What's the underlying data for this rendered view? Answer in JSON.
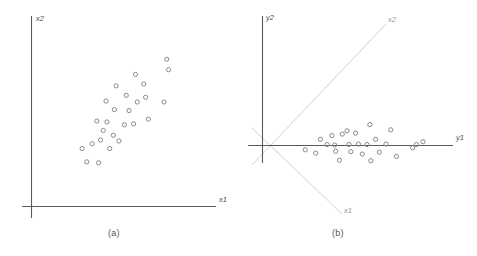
{
  "figure": {
    "background_color": "#ffffff",
    "axis_color": "#5a5a5a",
    "guide_color": "#d2d2d2",
    "point_color": "#8a8a8a",
    "caption_color": "#555555"
  },
  "panels": {
    "a": {
      "caption": "(a)",
      "x_axis_label": "x1",
      "y_axis_label": "x2"
    },
    "b": {
      "caption": "(b)",
      "x_axis_label": "y1",
      "y_axis_label": "y2",
      "rotated_x_axis_label": "x1",
      "rotated_y_axis_label": "x2"
    }
  },
  "chart_data": [
    {
      "type": "scatter",
      "title": "(a)",
      "xlabel": "x1",
      "ylabel": "x2",
      "grid": false,
      "legend": null,
      "axis_ticks": false,
      "xlim": [
        0,
        100
      ],
      "ylim": [
        0,
        100
      ],
      "description": "Positively correlated elliptical cloud of points in the original x1-x2 coordinate frame",
      "points": [
        {
          "x": 30.0,
          "y": 23.5
        },
        {
          "x": 36.5,
          "y": 23.0
        },
        {
          "x": 27.5,
          "y": 30.5
        },
        {
          "x": 33.0,
          "y": 33.0
        },
        {
          "x": 37.5,
          "y": 35.0
        },
        {
          "x": 42.5,
          "y": 30.5
        },
        {
          "x": 39.0,
          "y": 40.0
        },
        {
          "x": 44.5,
          "y": 37.5
        },
        {
          "x": 47.5,
          "y": 34.5
        },
        {
          "x": 35.5,
          "y": 45.0
        },
        {
          "x": 41.0,
          "y": 44.5
        },
        {
          "x": 50.5,
          "y": 43.0
        },
        {
          "x": 55.5,
          "y": 43.5
        },
        {
          "x": 45.0,
          "y": 51.0
        },
        {
          "x": 53.0,
          "y": 50.5
        },
        {
          "x": 63.5,
          "y": 46.0
        },
        {
          "x": 40.5,
          "y": 55.5
        },
        {
          "x": 57.5,
          "y": 55.0
        },
        {
          "x": 51.5,
          "y": 58.5
        },
        {
          "x": 62.0,
          "y": 57.5
        },
        {
          "x": 72.0,
          "y": 55.0
        },
        {
          "x": 46.0,
          "y": 63.5
        },
        {
          "x": 61.0,
          "y": 64.5
        },
        {
          "x": 56.5,
          "y": 69.5
        },
        {
          "x": 74.5,
          "y": 72.0
        },
        {
          "x": 73.5,
          "y": 77.5
        }
      ]
    },
    {
      "type": "scatter",
      "title": "(b)",
      "xlabel": "y1",
      "ylabel": "y2",
      "grid": false,
      "legend": null,
      "axis_ticks": false,
      "xlim": [
        0,
        100
      ],
      "ylim": [
        -50,
        50
      ],
      "description": "Same cloud after rotation onto principal axes y1 (long axis, horizontal) and y2 (short axis, vertical); the original x1 and x2 axes appear as light diagonals through the origin",
      "points": [
        {
          "x": 22.5,
          "y": -4.5
        },
        {
          "x": 28.0,
          "y": -8.0
        },
        {
          "x": 30.5,
          "y": 6.5
        },
        {
          "x": 34.0,
          "y": 1.0
        },
        {
          "x": 36.5,
          "y": 10.5
        },
        {
          "x": 38.0,
          "y": 0.5
        },
        {
          "x": 38.5,
          "y": -6.0
        },
        {
          "x": 40.5,
          "y": -15.5
        },
        {
          "x": 42.0,
          "y": 12.0
        },
        {
          "x": 44.5,
          "y": 15.5
        },
        {
          "x": 45.5,
          "y": 1.0
        },
        {
          "x": 46.5,
          "y": -6.5
        },
        {
          "x": 49.0,
          "y": 13.0
        },
        {
          "x": 50.5,
          "y": 1.5
        },
        {
          "x": 52.5,
          "y": -9.0
        },
        {
          "x": 55.0,
          "y": 1.0
        },
        {
          "x": 56.5,
          "y": 22.0
        },
        {
          "x": 57.0,
          "y": -16.0
        },
        {
          "x": 59.5,
          "y": 6.5
        },
        {
          "x": 61.5,
          "y": -7.0
        },
        {
          "x": 65.0,
          "y": 1.5
        },
        {
          "x": 67.5,
          "y": 16.5
        },
        {
          "x": 70.5,
          "y": -11.5
        },
        {
          "x": 79.0,
          "y": -2.5
        },
        {
          "x": 81.0,
          "y": 1.0
        },
        {
          "x": 84.5,
          "y": 4.0
        }
      ]
    }
  ]
}
